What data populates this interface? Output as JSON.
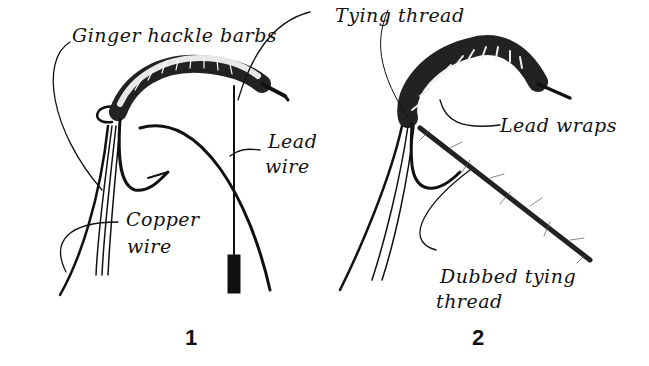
{
  "figures": [
    {
      "number": "1",
      "labels": {
        "hackle": "Ginger hackle barbs",
        "thread": "Tying thread",
        "lead_line1": "Lead",
        "lead_line2": "wire",
        "copper_line1": "Copper",
        "copper_line2": "wire"
      }
    },
    {
      "number": "2",
      "labels": {
        "lead_wraps": "Lead wraps",
        "dubbed_line1": "Dubbed tying",
        "dubbed_line2": "thread"
      }
    }
  ],
  "colors": {
    "ink": "#111111",
    "background": "#ffffff"
  }
}
